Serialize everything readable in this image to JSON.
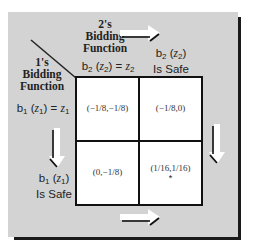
{
  "labels": {
    "player2_header": "2's Bidding Function",
    "player2_line1": "2's",
    "player2_line2": "Bidding",
    "player2_line3": "Function",
    "player1_line1": "1's",
    "player1_line2": "Bidding",
    "player1_line3": "Function",
    "col1": {
      "b": "b",
      "sub1": "2",
      "z": "z",
      "sub2": "2",
      "eq": "=",
      "z2": "z",
      "sub3": "2"
    },
    "col2": {
      "b": "b",
      "sub1": "2",
      "z": "z",
      "sub2": "2",
      "suffix": "Is Safe"
    },
    "row1": {
      "b": "b",
      "sub1": "1",
      "z": "z",
      "sub2": "1",
      "eq": "=",
      "z2": "z",
      "sub3": "1"
    },
    "row2": {
      "b": "b",
      "sub1": "1",
      "z": "z",
      "sub2": "1",
      "suffix": "Is Safe"
    }
  },
  "cells": [
    {
      "row": 1,
      "col": 1,
      "payoff": "(−1/8,−1/8)",
      "equilibrium": false
    },
    {
      "row": 1,
      "col": 2,
      "payoff": "(−1/8,0)",
      "equilibrium": false
    },
    {
      "row": 2,
      "col": 1,
      "payoff": "(0,−1/8)",
      "equilibrium": false
    },
    {
      "row": 2,
      "col": 2,
      "payoff": "(1/16,1/16)",
      "equilibrium": true,
      "marker": "*"
    }
  ],
  "arrows": [
    {
      "name": "top",
      "direction": "right"
    },
    {
      "name": "bottom",
      "direction": "right"
    },
    {
      "name": "left",
      "direction": "down"
    },
    {
      "name": "right",
      "direction": "down"
    }
  ],
  "colors": {
    "panel": "#d3d3d3",
    "cell": "#ffffff",
    "border": "#111111"
  }
}
